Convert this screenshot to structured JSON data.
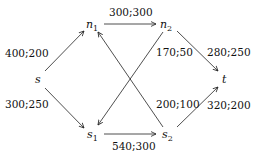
{
  "diagram": {
    "type": "flow-network",
    "nodes": [
      {
        "id": "s",
        "label": "s",
        "sub": ""
      },
      {
        "id": "n1",
        "label": "n",
        "sub": "1"
      },
      {
        "id": "n2",
        "label": "n",
        "sub": "2"
      },
      {
        "id": "s1",
        "label": "s",
        "sub": "1"
      },
      {
        "id": "s2",
        "label": "s",
        "sub": "2"
      },
      {
        "id": "t",
        "label": "t",
        "sub": ""
      }
    ],
    "edges": [
      {
        "from": "s",
        "to": "n1",
        "label": "400;200"
      },
      {
        "from": "s",
        "to": "s1",
        "label": "300;250"
      },
      {
        "from": "n1",
        "to": "n2",
        "label": "300;300"
      },
      {
        "from": "n2",
        "to": "s1",
        "label": "170;50"
      },
      {
        "from": "s2",
        "to": "n1",
        "label": "200;100"
      },
      {
        "from": "s1",
        "to": "s2",
        "label": "540;300"
      },
      {
        "from": "n2",
        "to": "t",
        "label": "280;250"
      },
      {
        "from": "s2",
        "to": "t",
        "label": "320;200"
      }
    ]
  }
}
